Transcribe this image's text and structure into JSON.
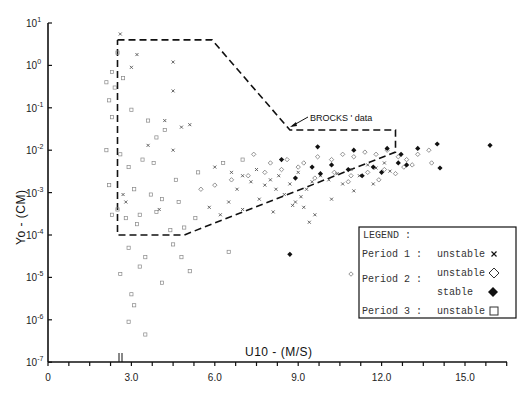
{
  "chart_data": {
    "type": "scatter",
    "title": "",
    "xlabel": "U10 - (M/S)",
    "ylabel": "Yo - (CM)",
    "xscale": "linear",
    "yscale": "log",
    "xlim": [
      0,
      16.5
    ],
    "ylim": [
      1e-07,
      10
    ],
    "x_ticks": [
      0,
      3.0,
      6.0,
      9.0,
      12.0,
      15.0
    ],
    "x_tick_labels": [
      "0",
      "3.0",
      "6.0",
      "9.0",
      "12.0",
      "15.0"
    ],
    "x_minor_step": 0.75,
    "y_ticks": [
      1,
      0,
      -1,
      -2,
      -3,
      -4,
      -5,
      -6,
      -7
    ],
    "y_tick_labels": [
      "10^1",
      "10^0",
      "10^-1",
      "10^-2",
      "10^-3",
      "10^-4",
      "10^-5",
      "10^-6",
      "10^-7"
    ],
    "grid": false,
    "axis_marker": {
      "x": 2.6,
      "label": "||"
    },
    "annotation": {
      "text": "BROCKS' data",
      "region_label": "BROCKS' data",
      "polygon": [
        [
          2.5,
          4.0
        ],
        [
          5.9,
          4.0
        ],
        [
          8.7,
          0.03
        ],
        [
          12.5,
          0.03
        ],
        [
          12.5,
          0.009
        ],
        [
          4.9,
          0.0001
        ],
        [
          2.5,
          0.0001
        ]
      ]
    },
    "legend": {
      "title": "LEGEND :",
      "position": "lower right",
      "entries": [
        {
          "period": "Period 1 :",
          "label": "unstable",
          "marker": "x"
        },
        {
          "period": "Period 2 :",
          "label": "unstable",
          "marker": "open-diamond"
        },
        {
          "period": "",
          "label": "stable",
          "marker": "filled-diamond"
        },
        {
          "period": "Period 3 :",
          "label": "unstable",
          "marker": "open-square"
        }
      ]
    },
    "series": [
      {
        "name": "Period 1 unstable",
        "marker": "x",
        "points": [
          [
            2.6,
            5.5
          ],
          [
            3.2,
            1.8
          ],
          [
            4.5,
            1.2
          ],
          [
            4.5,
            0.25
          ],
          [
            3.0,
            0.9
          ],
          [
            4.2,
            0.05
          ],
          [
            4.8,
            0.035
          ],
          [
            5.1,
            0.04
          ],
          [
            4.5,
            0.01
          ],
          [
            3.6,
            0.013
          ],
          [
            2.7,
            0.0009
          ],
          [
            2.8,
            0.0006
          ],
          [
            4.0,
            0.0004
          ],
          [
            6.0,
            0.004
          ],
          [
            6.6,
            0.003
          ],
          [
            7.0,
            0.0025
          ],
          [
            7.5,
            0.0035
          ],
          [
            7.3,
            0.0018
          ],
          [
            6.8,
            0.0012
          ],
          [
            7.8,
            0.0015
          ],
          [
            8.0,
            0.002
          ],
          [
            8.2,
            0.0012
          ],
          [
            8.5,
            0.0009
          ],
          [
            8.3,
            0.0025
          ],
          [
            8.7,
            0.0016
          ],
          [
            8.9,
            0.0006
          ],
          [
            9.1,
            0.0008
          ],
          [
            9.3,
            0.0012
          ],
          [
            9.5,
            0.0018
          ],
          [
            9.0,
            0.003
          ],
          [
            9.8,
            0.0025
          ],
          [
            10.1,
            0.002
          ],
          [
            10.4,
            0.0028
          ],
          [
            10.6,
            0.0016
          ],
          [
            10.9,
            0.0035
          ],
          [
            11.2,
            0.0025
          ],
          [
            11.5,
            0.0045
          ],
          [
            11.8,
            0.0038
          ],
          [
            12.1,
            0.005
          ],
          [
            12.3,
            0.0032
          ],
          [
            6.5,
            0.0006
          ],
          [
            7.0,
            0.0004
          ],
          [
            6.2,
            0.0003
          ],
          [
            8.1,
            0.00035
          ],
          [
            9.2,
            0.00045
          ],
          [
            9.6,
            0.0003
          ],
          [
            10.2,
            0.0007
          ],
          [
            11.0,
            0.0011
          ],
          [
            11.7,
            0.0016
          ],
          [
            5.8,
            0.00045
          ],
          [
            7.6,
            0.0007
          ],
          [
            8.8,
            0.0005
          ],
          [
            9.4,
            0.0002
          ]
        ]
      },
      {
        "name": "Period 2 unstable",
        "marker": "open-diamond",
        "points": [
          [
            7.4,
            0.008
          ],
          [
            8.0,
            0.005
          ],
          [
            8.6,
            0.006
          ],
          [
            9.2,
            0.005
          ],
          [
            9.7,
            0.007
          ],
          [
            10.2,
            0.006
          ],
          [
            10.6,
            0.008
          ],
          [
            11.0,
            0.007
          ],
          [
            11.4,
            0.009
          ],
          [
            11.8,
            0.008
          ],
          [
            12.2,
            0.01
          ],
          [
            12.6,
            0.007
          ],
          [
            12.9,
            0.006
          ],
          [
            13.3,
            0.008
          ],
          [
            13.7,
            0.01
          ],
          [
            13.8,
            0.005
          ],
          [
            12.8,
            0.004
          ],
          [
            12.1,
            0.0035
          ],
          [
            11.5,
            0.003
          ],
          [
            10.9,
            0.0025
          ],
          [
            10.3,
            0.003
          ],
          [
            9.6,
            0.0022
          ],
          [
            9.0,
            0.004
          ],
          [
            8.4,
            0.0035
          ],
          [
            7.8,
            0.003
          ],
          [
            7.2,
            0.0025
          ],
          [
            6.6,
            0.002
          ],
          [
            6.0,
            0.0015
          ],
          [
            5.5,
            0.0012
          ],
          [
            11.9,
            0.002
          ],
          [
            12.5,
            0.0028
          ],
          [
            13.1,
            0.0045
          ],
          [
            10.8,
            0.0018
          ],
          [
            10.9,
            1.2e-05
          ]
        ]
      },
      {
        "name": "Period 2 stable",
        "marker": "filled-diamond",
        "points": [
          [
            8.4,
            0.006
          ],
          [
            9.7,
            0.012
          ],
          [
            11.0,
            0.01
          ],
          [
            12.2,
            0.011
          ],
          [
            12.7,
            0.008
          ],
          [
            13.3,
            0.011
          ],
          [
            14.0,
            0.014
          ],
          [
            15.9,
            0.013
          ],
          [
            14.1,
            0.0038
          ],
          [
            12.9,
            0.0045
          ],
          [
            12.6,
            0.005
          ],
          [
            11.7,
            0.004
          ],
          [
            10.8,
            0.0035
          ],
          [
            10.2,
            0.0045
          ],
          [
            9.8,
            0.0028
          ],
          [
            8.9,
            0.0022
          ],
          [
            9.5,
            0.004
          ],
          [
            11.3,
            0.0025
          ],
          [
            12.0,
            0.003
          ],
          [
            8.7,
            3.5e-05
          ]
        ]
      },
      {
        "name": "Period 3 unstable",
        "marker": "open-square",
        "points": [
          [
            2.5,
            2.0
          ],
          [
            2.3,
            0.7
          ],
          [
            2.7,
            0.5
          ],
          [
            2.1,
            0.4
          ],
          [
            2.4,
            0.3
          ],
          [
            2.2,
            0.15
          ],
          [
            3.0,
            0.09
          ],
          [
            2.3,
            0.06
          ],
          [
            3.6,
            0.05
          ],
          [
            4.2,
            0.03
          ],
          [
            3.9,
            0.02
          ],
          [
            2.1,
            0.01
          ],
          [
            2.6,
            0.008
          ],
          [
            3.4,
            0.006
          ],
          [
            2.9,
            0.004
          ],
          [
            3.8,
            0.005
          ],
          [
            4.6,
            0.002
          ],
          [
            5.4,
            0.003
          ],
          [
            6.3,
            0.005
          ],
          [
            7.0,
            0.006
          ],
          [
            2.2,
            0.0015
          ],
          [
            3.1,
            0.0012
          ],
          [
            3.7,
            0.0009
          ],
          [
            4.1,
            0.0007
          ],
          [
            2.5,
            0.0004
          ],
          [
            3.3,
            0.0003
          ],
          [
            3.9,
            0.00035
          ],
          [
            4.7,
            0.0006
          ],
          [
            5.3,
            0.00025
          ],
          [
            2.3,
            0.0003
          ],
          [
            2.8,
            0.00025
          ],
          [
            3.2,
            0.00018
          ],
          [
            4.4,
            0.00013
          ],
          [
            4.9,
            0.00015
          ],
          [
            2.9,
            5e-05
          ],
          [
            3.5,
            3e-05
          ],
          [
            4.5,
            6e-05
          ],
          [
            3.3,
            1.8e-05
          ],
          [
            4.1,
            7.5e-06
          ],
          [
            3.0,
            4e-06
          ],
          [
            3.1,
            2.2e-06
          ],
          [
            3.5,
            4.5e-07
          ],
          [
            2.9,
            9e-07
          ],
          [
            6.5,
            4e-05
          ],
          [
            4.8,
            3e-05
          ],
          [
            5.1,
            1.4e-05
          ],
          [
            2.6,
            1.2e-05
          ]
        ]
      }
    ]
  },
  "axes": {
    "x_title": "U10 - (M/S)",
    "y_title_main": "Yo - (CM)",
    "y_tick_bases": [
      "10",
      "10",
      "10",
      "10",
      "10",
      "10",
      "10",
      "10",
      "10"
    ],
    "y_tick_exps": [
      "1",
      "0",
      "-1",
      "-2",
      "-3",
      "-4",
      "-5",
      "-6",
      "-7"
    ],
    "x_tick_labels": [
      "0",
      "3.0",
      "6.0",
      "9.0",
      "12.0",
      "15.0"
    ]
  },
  "annotation": {
    "label": "BROCKS ' data"
  },
  "legend": {
    "title": "LEGEND :",
    "period1": "Period 1 :",
    "period2": "Period 2 :",
    "period3": "Period 3 :",
    "p1_label": "unstable",
    "p2_unstable_label": "unstable",
    "p2_stable_label": "stable",
    "p3_label": "unstable"
  },
  "colors": {
    "ink": "#111111",
    "marker_light": "#555555",
    "background": "#ffffff"
  }
}
